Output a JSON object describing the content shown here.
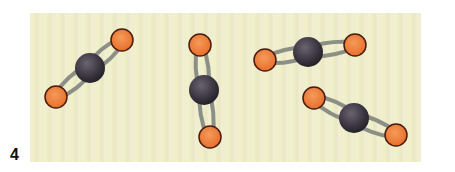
{
  "figure": {
    "label": "4",
    "background_color": "#f0eecf",
    "colors": {
      "carbon": "#3f3a45",
      "oxygen": "#ef7f3a",
      "oxygen_outline": "#4a1d10",
      "bond": "#8c8f86"
    },
    "molecules": [
      {
        "name": "CO2 molecule 1",
        "center": [
          90,
          68
        ],
        "oxygens": [
          [
            122,
            40
          ],
          [
            56,
            97
          ]
        ]
      },
      {
        "name": "CO2 molecule 2",
        "center": [
          204,
          90
        ],
        "oxygens": [
          [
            200,
            45
          ],
          [
            210,
            137
          ]
        ]
      },
      {
        "name": "CO2 molecule 3",
        "center": [
          308,
          52
        ],
        "oxygens": [
          [
            265,
            60
          ],
          [
            355,
            45
          ]
        ]
      },
      {
        "name": "CO2 molecule 4",
        "center": [
          354,
          118
        ],
        "oxygens": [
          [
            314,
            98
          ],
          [
            396,
            135
          ]
        ]
      }
    ]
  }
}
